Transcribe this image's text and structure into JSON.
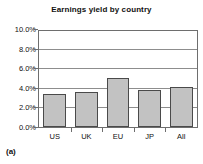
{
  "chart_data": {
    "type": "bar",
    "title": "Earnings yield by country",
    "xlabel": "",
    "ylabel": "",
    "categories": [
      "US",
      "UK",
      "EU",
      "JP",
      "All"
    ],
    "values": [
      3.4,
      3.6,
      5.1,
      3.9,
      4.2
    ],
    "value_unit": "%",
    "ylim": [
      0,
      10
    ],
    "ytick_values": [
      0,
      2,
      4,
      6,
      8,
      10
    ],
    "ytick_labels": [
      "0.0%",
      "2.0%",
      "4.0%",
      "6.0%",
      "8.0%",
      "10.0%"
    ],
    "grid": true,
    "grid_axis": "y",
    "legend": false,
    "legend_position": "none",
    "bar_fill_color": "#c2c2c2",
    "bar_edge_color": "#4a4a4a",
    "plot_border_color": "#6e6e6e",
    "gridline_color": "#8d8d8d",
    "background_color": "#ffffff",
    "text_color": "#111111"
  },
  "figure": {
    "caption": "(a)"
  }
}
